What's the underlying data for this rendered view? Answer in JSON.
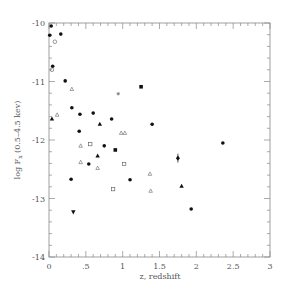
{
  "chart_data": {
    "type": "scatter",
    "title": "",
    "xlabel": "z, redshift",
    "ylabel": "log F_x (0.5–4.5 kev)",
    "ylabel_main": "log F",
    "ylabel_sub": "x",
    "ylabel_tail": " (0.5–4.5 kev)",
    "xlim": [
      0,
      3
    ],
    "ylim": [
      -14,
      -10
    ],
    "grid": false,
    "legend": "none",
    "x_ticks": [
      {
        "value": 0,
        "label": "0"
      },
      {
        "value": 0.5,
        "label": ".5"
      },
      {
        "value": 1,
        "label": "1"
      },
      {
        "value": 1.5,
        "label": "1.5"
      },
      {
        "value": 2,
        "label": "2"
      },
      {
        "value": 2.5,
        "label": "2.5"
      },
      {
        "value": 3,
        "label": "3"
      }
    ],
    "y_ticks": [
      {
        "value": -10,
        "label": "-10"
      },
      {
        "value": -11,
        "label": "-11"
      },
      {
        "value": -12,
        "label": "-12"
      },
      {
        "value": -13,
        "label": "-13"
      },
      {
        "value": -14,
        "label": "-14"
      }
    ],
    "x_minor_step": 0.1,
    "y_minor_step": 0.2,
    "points": [
      {
        "x": 0.03,
        "y": -10.05,
        "marker": "filled-circle"
      },
      {
        "x": 0.01,
        "y": -10.21,
        "marker": "filled-circle"
      },
      {
        "x": 0.16,
        "y": -10.19,
        "marker": "filled-circle"
      },
      {
        "x": 0.08,
        "y": -10.32,
        "marker": "open-circle"
      },
      {
        "x": 0.05,
        "y": -10.74,
        "marker": "filled-circle"
      },
      {
        "x": 0.04,
        "y": -10.8,
        "marker": "open-circle"
      },
      {
        "x": 0.22,
        "y": -10.99,
        "marker": "filled-circle"
      },
      {
        "x": 0.31,
        "y": -11.13,
        "marker": "open-triangle"
      },
      {
        "x": 0.11,
        "y": -11.57,
        "marker": "open-triangle"
      },
      {
        "x": 0.04,
        "y": -11.64,
        "marker": "filled-triangle"
      },
      {
        "x": 0.31,
        "y": -11.45,
        "marker": "filled-circle"
      },
      {
        "x": 0.42,
        "y": -11.56,
        "marker": "filled-circle"
      },
      {
        "x": 0.6,
        "y": -11.54,
        "marker": "filled-circle"
      },
      {
        "x": 0.69,
        "y": -11.73,
        "marker": "filled-triangle"
      },
      {
        "x": 0.85,
        "y": -11.64,
        "marker": "filled-circle"
      },
      {
        "x": 0.41,
        "y": -11.85,
        "marker": "filled-circle"
      },
      {
        "x": 0.94,
        "y": -11.21,
        "marker": "asterisk"
      },
      {
        "x": 0.98,
        "y": -11.88,
        "marker": "open-triangle"
      },
      {
        "x": 1.03,
        "y": -11.88,
        "marker": "open-triangle"
      },
      {
        "x": 1.25,
        "y": -11.09,
        "marker": "filled-square"
      },
      {
        "x": 1.4,
        "y": -11.73,
        "marker": "filled-circle"
      },
      {
        "x": 0.43,
        "y": -12.1,
        "marker": "open-triangle"
      },
      {
        "x": 0.56,
        "y": -12.07,
        "marker": "open-square"
      },
      {
        "x": 0.75,
        "y": -12.1,
        "marker": "filled-circle"
      },
      {
        "x": 0.9,
        "y": -12.17,
        "marker": "filled-square"
      },
      {
        "x": 0.66,
        "y": -12.27,
        "marker": "filled-triangle"
      },
      {
        "x": 0.43,
        "y": -12.38,
        "marker": "open-triangle"
      },
      {
        "x": 0.54,
        "y": -12.41,
        "marker": "filled-circle"
      },
      {
        "x": 0.66,
        "y": -12.48,
        "marker": "open-triangle"
      },
      {
        "x": 1.02,
        "y": -12.41,
        "marker": "open-square"
      },
      {
        "x": 0.3,
        "y": -12.67,
        "marker": "filled-circle"
      },
      {
        "x": 1.1,
        "y": -12.68,
        "marker": "filled-circle"
      },
      {
        "x": 0.87,
        "y": -12.84,
        "marker": "open-square"
      },
      {
        "x": 0.33,
        "y": -13.23,
        "marker": "filled-triangle-down"
      },
      {
        "x": 2.36,
        "y": -12.05,
        "marker": "filled-circle"
      },
      {
        "x": 1.75,
        "y": -12.31,
        "marker": "filled-diamond-errorbar"
      },
      {
        "x": 1.37,
        "y": -12.58,
        "marker": "open-triangle"
      },
      {
        "x": 1.38,
        "y": -12.87,
        "marker": "open-triangle"
      },
      {
        "x": 1.8,
        "y": -12.79,
        "marker": "filled-triangle"
      },
      {
        "x": 1.93,
        "y": -13.18,
        "marker": "filled-circle"
      }
    ]
  }
}
